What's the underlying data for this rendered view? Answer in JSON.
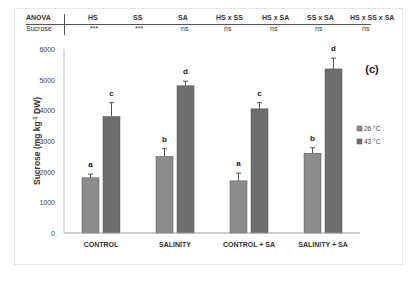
{
  "anova": {
    "header_label": "ANOVA",
    "row_label": "Sucrose",
    "columns": [
      "HS",
      "SS",
      "SA",
      "HS x SS",
      "HS x SA",
      "SS x SA",
      "HS x SS x SA"
    ],
    "values": [
      "***",
      "***",
      "ns",
      "ns",
      "ns",
      "ns",
      "ns"
    ]
  },
  "panel_label": "(c)",
  "chart_data": {
    "type": "bar",
    "title": "",
    "xlabel": "",
    "ylabel": "Sucrose (mg kg-1 DW)",
    "ylim": [
      0,
      6000
    ],
    "yticks": [
      0,
      1000,
      2000,
      3000,
      4000,
      5000,
      6000
    ],
    "grid": false,
    "legend_position": "right",
    "categories": [
      "CONTROL",
      "SALINITY",
      "CONTROL + SA",
      "SALINITY + SA"
    ],
    "series": [
      {
        "name": "26 °C",
        "color": "#8c8c8c",
        "values": [
          1800,
          2500,
          1700,
          2600
        ],
        "errors": [
          120,
          250,
          250,
          180
        ],
        "letters": [
          "a",
          "b",
          "a",
          "b"
        ]
      },
      {
        "name": "43 °C",
        "color": "#6e6e6e",
        "values": [
          3800,
          4800,
          4050,
          5350
        ],
        "errors": [
          450,
          150,
          200,
          350
        ],
        "letters": [
          "c",
          "d",
          "c",
          "d"
        ]
      }
    ]
  }
}
